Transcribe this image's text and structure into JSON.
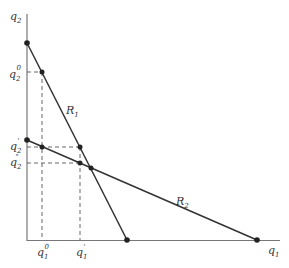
{
  "diagram": {
    "type": "economics-reaction-curves",
    "axes": {
      "x_label": "q",
      "x_label_sub": "1",
      "y_label": "q",
      "y_label_sub": "2"
    },
    "curves": [
      {
        "name": "R",
        "sub": "1"
      },
      {
        "name": "R",
        "sub": "2"
      }
    ],
    "y_ticks": [
      {
        "base": "q",
        "sub": "2",
        "sup": "0"
      },
      {
        "base": "q",
        "sub": "2",
        "sup": "'"
      },
      {
        "base": "q",
        "sub": "2",
        "sup": "\""
      }
    ],
    "x_ticks": [
      {
        "base": "q",
        "sub": "1",
        "sup": "0"
      },
      {
        "base": "q",
        "sub": "1",
        "sup": "'"
      }
    ],
    "colors": {
      "line": "#333333",
      "axis": "#555555",
      "dash": "#444444"
    }
  }
}
